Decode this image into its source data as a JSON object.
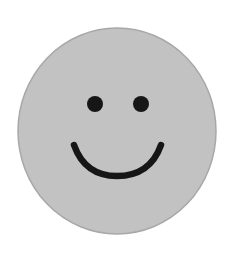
{
  "image": {
    "subject": "smiley-face",
    "description": "Gray circular smiley face with two black dot eyes and a curved smile"
  },
  "colors": {
    "background": "#ffffff",
    "face_fill": "#c2c2c2",
    "face_edge": "#a8a8a8",
    "features": "#161616"
  }
}
